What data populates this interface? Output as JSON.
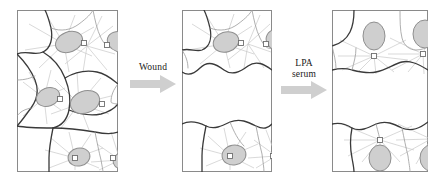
{
  "figure": {
    "type": "scientific-diagram",
    "background_color": "#ffffff"
  },
  "colors": {
    "panel_border": "#8a8a8a",
    "cell_outline_dark": "#3a3a3a",
    "cell_outline_light": "#9a9a9a",
    "nucleus_fill": "#cfcfcf",
    "nucleus_stroke": "#8f8f8f",
    "microtubule": "#c9c9c9",
    "centrosome_fill": "#ffffff",
    "centrosome_stroke": "#6f6f6f",
    "arrow_fill": "#cfcfcf",
    "text": "#1a1a1a"
  },
  "panels": [
    {
      "id": "panel-1",
      "name": "confluent-monolayer",
      "state": "Confluent monolayer",
      "x": 17,
      "y": 10,
      "width": 101,
      "height": 162,
      "has_wound": false,
      "cells": [
        {
          "nucleus_cx": 52,
          "nucleus_cy": 32,
          "rx": 14,
          "ry": 10,
          "rot": -22,
          "centrosome_x": 68,
          "centrosome_y": 34
        },
        {
          "nucleus_cx": 103,
          "nucleus_cy": 32,
          "rx": 13,
          "ry": 10,
          "rot": 20,
          "centrosome_x": 90,
          "centrosome_y": 34
        },
        {
          "nucleus_cx": 31,
          "nucleus_cy": 87,
          "rx": 12,
          "ry": 9,
          "rot": -20,
          "centrosome_x": 43,
          "centrosome_y": 90
        },
        {
          "nucleus_cx": 68,
          "nucleus_cy": 92,
          "rx": 15,
          "ry": 11,
          "rot": -20,
          "centrosome_x": 85,
          "centrosome_y": 95
        },
        {
          "nucleus_cx": 62,
          "nucleus_cy": 147,
          "rx": 11,
          "ry": 9,
          "rot": -12,
          "centrosome_x": 63,
          "centrosome_y": 147
        },
        {
          "nucleus_cx": 108,
          "nucleus_cy": 150,
          "rx": 12,
          "ry": 9,
          "rot": -18,
          "centrosome_x": 96,
          "centrosome_y": 147
        }
      ]
    },
    {
      "id": "panel-2",
      "name": "wounded-monolayer",
      "state": "Immediately after wounding",
      "x": 182,
      "y": 10,
      "width": 90,
      "height": 162,
      "has_wound": true,
      "wound_top": 62,
      "wound_bottom": 112,
      "cells": [
        {
          "nucleus_cx": 44,
          "nucleus_cy": 32,
          "rx": 13,
          "ry": 10,
          "rot": -18,
          "centrosome_x": 59,
          "centrosome_y": 34
        },
        {
          "nucleus_cx": 97,
          "nucleus_cy": 30,
          "rx": 13,
          "ry": 11,
          "rot": 15,
          "centrosome_x": 84,
          "centrosome_y": 34
        },
        {
          "nucleus_cx": 52,
          "nucleus_cy": 145,
          "rx": 12,
          "ry": 10,
          "rot": -10,
          "centrosome_x": 54,
          "centrosome_y": 145
        },
        {
          "nucleus_cx": 104,
          "nucleus_cy": 146,
          "rx": 12,
          "ry": 9,
          "rot": -15,
          "centrosome_x": 91,
          "centrosome_y": 145
        }
      ]
    },
    {
      "id": "panel-3",
      "name": "polarized-monolayer",
      "state": "After LPA/serum: centrosome reoriented toward wound",
      "x": 332,
      "y": 10,
      "width": 96,
      "height": 162,
      "has_wound": true,
      "wound_top": 62,
      "wound_bottom": 112,
      "cells": [
        {
          "nucleus_cx": 42,
          "nucleus_cy": 26,
          "rx": 11,
          "ry": 14,
          "rot": 0,
          "centrosome_x": 43,
          "centrosome_y": 46
        },
        {
          "nucleus_cx": 93,
          "nucleus_cy": 24,
          "rx": 12,
          "ry": 14,
          "rot": 0,
          "centrosome_x": 92,
          "centrosome_y": 44
        },
        {
          "nucleus_cx": 48,
          "nucleus_cy": 148,
          "rx": 11,
          "ry": 13,
          "rot": 0,
          "centrosome_x": 48,
          "centrosome_y": 130
        },
        {
          "nucleus_cx": 99,
          "nucleus_cy": 148,
          "rx": 11,
          "ry": 13,
          "rot": 0,
          "centrosome_x": 99,
          "centrosome_y": 129
        }
      ]
    }
  ],
  "arrows": [
    {
      "id": "arrow-1",
      "name": "wound-arrow",
      "label_lines": [
        "Wound"
      ],
      "x": 124,
      "y": 62,
      "width": 58,
      "direction": "right"
    },
    {
      "id": "arrow-2",
      "name": "lpa-serum-arrow",
      "label_lines": [
        "LPA",
        "serum"
      ],
      "x": 276,
      "y": 58,
      "width": 56,
      "direction": "right"
    }
  ]
}
